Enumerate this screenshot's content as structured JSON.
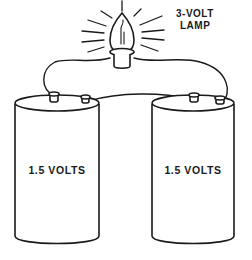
{
  "diagram": {
    "lamp": {
      "label_line1": "3-VOLT",
      "label_line2": "LAMP",
      "icon": "light-bulb-icon"
    },
    "batteries": [
      {
        "label": "1.5 VOLTS",
        "icon": "battery-cell-icon"
      },
      {
        "label": "1.5 VOLTS",
        "icon": "battery-cell-icon"
      }
    ],
    "connections": [
      {
        "from": "lamp",
        "to": "left-battery-terminal-1"
      },
      {
        "from": "left-battery-terminal-2",
        "to": "right-battery-terminal-1"
      },
      {
        "from": "right-battery-terminal-2",
        "to": "lamp"
      }
    ],
    "colors": {
      "ink": "#1a1a1a",
      "background": "#ffffff"
    }
  }
}
